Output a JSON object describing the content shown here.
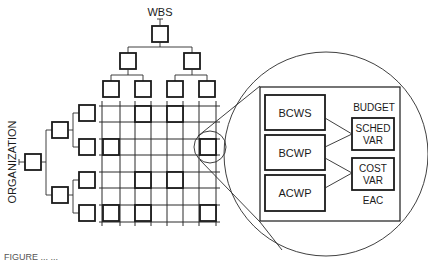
{
  "labels": {
    "wbs": "WBS",
    "organization": "ORGANIZATION",
    "budget": "BUDGET",
    "bcws": "BCWS",
    "bcwp": "BCWP",
    "acwp": "ACWP",
    "sched_var_line1": "SCHED",
    "sched_var_line2": "VAR",
    "cost_var_line1": "COST",
    "cost_var_line2": "VAR",
    "eac": "EAC"
  },
  "caption": "FIGURE ... ...",
  "colors": {
    "line": "#1a1a1a",
    "background": "#ffffff"
  }
}
